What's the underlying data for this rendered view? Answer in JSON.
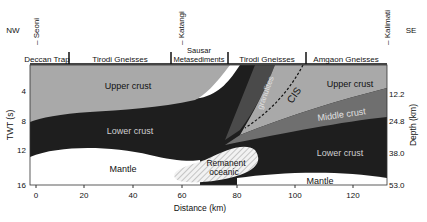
{
  "direction": {
    "left": "NW",
    "right": "SE"
  },
  "locations": [
    {
      "name": "Seoni",
      "x_km": 0
    },
    {
      "name": "Katangi",
      "x_km": 60
    },
    {
      "name": "Kalimati",
      "x_km": 120
    }
  ],
  "geology_units": [
    "Deccan Trap",
    "Tirodi Gneisses",
    "Sausar Metasediments",
    "Tirodi Gneisses",
    "Amgaon Gneisses"
  ],
  "layers": {
    "upper_crust_left": "Upper crust",
    "lower_crust_left": "Lower crust",
    "mantle_left": "Mantle",
    "remnant": "Remanent oceanic",
    "granulites": "granulites",
    "cis": "CIS",
    "upper_crust_right": "Upper crust",
    "middle_crust_right": "Middle crust",
    "lower_crust_right": "Lower crust",
    "mantle_right": "Mantle"
  },
  "axes": {
    "x_label": "Distance (km)",
    "x_ticks": [
      "0",
      "20",
      "40",
      "60",
      "80",
      "100",
      "120"
    ],
    "y_left_label": "TWT (s)",
    "y_left_ticks": [
      "4",
      "8",
      "12",
      "16"
    ],
    "y_right_label": "Depth (km)",
    "y_right_ticks": [
      "12.2",
      "24.8",
      "38.0",
      "53.0"
    ]
  },
  "colors": {
    "upper_crust": "#a9a9a9",
    "lower_crust": "#1e1e1e",
    "middle_crust": "#6f6f6f",
    "granulites": "#4a4a4a",
    "mantle": "#ffffff"
  }
}
